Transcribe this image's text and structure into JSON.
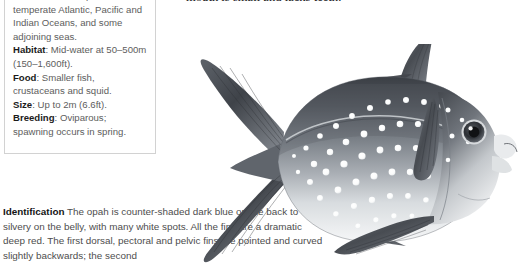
{
  "info_box": {
    "name": "species-factfile",
    "entries": [
      {
        "key": "Distribution",
        "value": ": Tropical and temperate Atlantic, Pacific and Indian Oceans, and some adjoining seas."
      },
      {
        "key": "Habitat",
        "value": ": Mid-water at 50–500m (150–1,600ft)."
      },
      {
        "key": "Food",
        "value": ": Smaller fish, crustaceans and squid."
      },
      {
        "key": "Size",
        "value": ": Up to 2m (6.6ft)."
      },
      {
        "key": "Breeding",
        "value": ": Oviparous; spawning occurs in spring."
      }
    ]
  },
  "serif_column": {
    "line_cut": "spawning p… crustaceans and small squid.",
    "paragraph": "crustaceans and small squid. The mouth is small and lacks teeth."
  },
  "identification": {
    "label": "Identification",
    "body": " The opah is counter-shaded dark blue on the back to silvery on the belly, with many white spots. All the fins are a dramatic deep red. The first dorsal, pectoral and pelvic fins are pointed and curved slightly backwards; the second"
  },
  "illustration": {
    "name": "opah-fish-illustration",
    "subject": "opah",
    "style": "grayscale airbrush painting",
    "features": [
      "forked-caudal-fin",
      "first-dorsal-fin",
      "pectoral-fin",
      "pelvic-fin",
      "anal-fin",
      "large-eye",
      "white-spots"
    ]
  },
  "colors": {
    "page_background": "#ffffff",
    "box_border": "#d2d2d2",
    "body_text": "#5d5d5d",
    "bold_text": "#1b1b1b",
    "serif_text": "#17171a",
    "fish_dark": "#3c4045",
    "fish_mid": "#8d9299",
    "fish_light": "#eceef0",
    "fin_dark": "#4a4e54",
    "eye_pupil": "#111214"
  }
}
